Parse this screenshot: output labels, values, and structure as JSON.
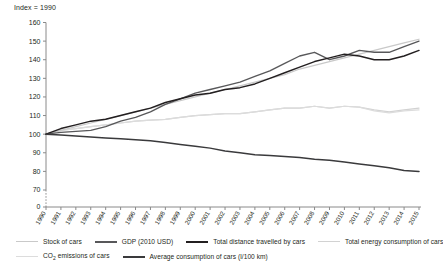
{
  "chart_data": {
    "type": "line",
    "title": "Index = 1990",
    "xlabel": "",
    "ylabel": "Index = 1990",
    "ylim": [
      70,
      160
    ],
    "yticks": [
      0,
      70,
      80,
      90,
      100,
      110,
      120,
      130,
      140,
      150,
      160
    ],
    "axis_break": true,
    "grid": false,
    "legend_position": "bottom",
    "categories": [
      1990,
      1991,
      1992,
      1993,
      1994,
      1995,
      1996,
      1997,
      1998,
      1999,
      2000,
      2001,
      2002,
      2003,
      2004,
      2005,
      2006,
      2007,
      2008,
      2009,
      2010,
      2011,
      2012,
      2013,
      2014,
      2015
    ],
    "series": [
      {
        "name": "Stock of cars",
        "color": "#c9c9c9",
        "values": [
          100,
          102,
          104,
          106,
          108,
          110,
          112,
          114,
          116,
          118,
          120,
          122,
          124,
          126,
          128,
          130,
          132,
          135,
          137,
          139,
          141,
          143,
          145,
          147,
          149,
          151
        ]
      },
      {
        "name": "GDP (2010 USD)",
        "color": "#58585a",
        "values": [
          100,
          101,
          101.5,
          102,
          104,
          107,
          109,
          112,
          116,
          119,
          122,
          124,
          126,
          128,
          131,
          134,
          138,
          142,
          144,
          140,
          142,
          145,
          144,
          144,
          147,
          150
        ]
      },
      {
        "name": "Total distance travelled by cars",
        "color": "#231f20",
        "values": [
          100,
          103,
          105,
          107,
          108,
          110,
          112,
          114,
          117,
          119,
          121,
          122,
          124,
          125,
          127,
          130,
          133,
          136,
          139,
          141,
          143,
          142,
          140,
          140,
          142,
          145
        ]
      },
      {
        "name": "Total energy consumption of cars",
        "color": "#d2d2d2",
        "values": [
          100,
          102,
          103,
          104,
          105,
          106,
          107,
          107.5,
          108,
          109,
          110,
          110.5,
          111,
          111,
          112,
          113,
          114,
          114,
          115,
          114,
          115,
          114.5,
          113,
          112,
          113,
          114
        ]
      },
      {
        "name": "CO2 emissions of cars",
        "color": "#dcdcdc",
        "values": [
          100,
          102,
          103,
          104,
          105,
          106,
          107,
          107.5,
          108,
          109,
          110,
          110.5,
          111,
          111,
          112,
          113,
          114,
          114,
          115,
          114,
          115,
          114.5,
          112.5,
          111.5,
          112.5,
          113
        ]
      },
      {
        "name": "Average consumption of cars (l/100 km)",
        "color": "#3a3a3c",
        "values": [
          100,
          99.5,
          99,
          98.5,
          98,
          97.5,
          97,
          96.5,
          95.5,
          94.5,
          93.5,
          92.5,
          91,
          90,
          89,
          88.5,
          88,
          87.5,
          86.5,
          86,
          85,
          84,
          83,
          82,
          80.5,
          80
        ]
      }
    ]
  },
  "legend": {
    "row1": [
      {
        "label": "Stock of cars",
        "color": "#c9c9c9",
        "width": 1.4
      },
      {
        "label": "GDP (2010 USD)",
        "color": "#58585a",
        "width": 2.1
      },
      {
        "label": "Total distance travelled by cars",
        "color": "#231f20",
        "width": 2.1
      },
      {
        "label": "Total energy consumption of cars",
        "color": "#d2d2d2",
        "width": 1.4
      }
    ],
    "row2": [
      {
        "label": "CO₂ emissions of cars",
        "color": "#dcdcdc",
        "width": 1.4
      },
      {
        "label": "Average consumption of cars (l/100 km)",
        "color": "#3a3a3c",
        "width": 2.1
      }
    ]
  }
}
